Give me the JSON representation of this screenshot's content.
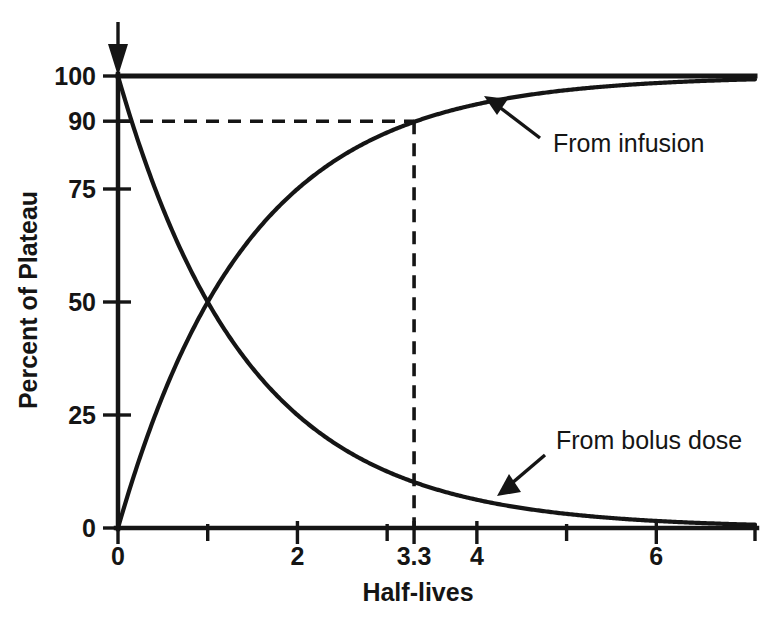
{
  "chart_data": {
    "type": "line",
    "title": "",
    "xlabel": "Half-lives",
    "ylabel": "Percent of Plateau",
    "xlim": [
      0,
      7.1
    ],
    "ylim": [
      0,
      104
    ],
    "grid": false,
    "legend_position": "inline-annotations",
    "x_ticks": [
      {
        "value": 0,
        "label": "0"
      },
      {
        "value": 1,
        "label": ""
      },
      {
        "value": 2,
        "label": "2"
      },
      {
        "value": 3,
        "label": ""
      },
      {
        "value": 3.3,
        "label": "3.3"
      },
      {
        "value": 4,
        "label": "4"
      },
      {
        "value": 5,
        "label": ""
      },
      {
        "value": 6,
        "label": "6"
      },
      {
        "value": 7.1,
        "label": ""
      }
    ],
    "y_ticks": [
      {
        "value": 0,
        "label": "0"
      },
      {
        "value": 25,
        "label": "25"
      },
      {
        "value": 50,
        "label": "50"
      },
      {
        "value": 75,
        "label": "75"
      },
      {
        "value": 90,
        "label": "90"
      },
      {
        "value": 100,
        "label": "100"
      }
    ],
    "series": [
      {
        "name": "From infusion",
        "formula": "100 * (1 - 2^-t)",
        "x": [
          0,
          0.25,
          0.5,
          0.75,
          1,
          1.25,
          1.5,
          1.75,
          2,
          2.5,
          3,
          3.3,
          3.5,
          4,
          4.5,
          5,
          5.5,
          6,
          6.5,
          7.1
        ],
        "values": [
          0,
          15.9,
          29.3,
          40.5,
          50,
          57.9,
          64.6,
          70.3,
          75,
          82.3,
          87.5,
          89.9,
          91.2,
          93.8,
          95.6,
          96.9,
          97.8,
          98.4,
          98.9,
          99.3
        ]
      },
      {
        "name": "From bolus dose",
        "formula": "100 * 2^-t",
        "x": [
          0,
          0.25,
          0.5,
          0.75,
          1,
          1.25,
          1.5,
          1.75,
          2,
          2.5,
          3,
          3.3,
          3.5,
          4,
          4.5,
          5,
          5.5,
          6,
          6.5,
          7.1
        ],
        "values": [
          100,
          84.1,
          70.7,
          59.5,
          50,
          42.0,
          35.4,
          29.7,
          25,
          17.7,
          12.5,
          10.1,
          8.8,
          6.25,
          4.4,
          3.1,
          2.2,
          1.56,
          1.1,
          0.7
        ]
      },
      {
        "name": "Plateau (100%)",
        "formula": "100",
        "x": [
          0,
          7.1
        ],
        "values": [
          100,
          100
        ]
      }
    ],
    "annotations": [
      {
        "name": "from-infusion-label",
        "text": "From infusion",
        "x": 4.35,
        "y": 78
      },
      {
        "name": "from-bolus-label",
        "text": "From bolus dose",
        "x": 5.05,
        "y": 24
      },
      {
        "name": "dose-arrow",
        "text": "",
        "x": 0,
        "y": 100
      }
    ],
    "reference_lines": [
      {
        "name": "ninety-percent-horizontal",
        "orientation": "horizontal",
        "value": 90,
        "style": "dashed",
        "from": 0,
        "to": 3.3
      },
      {
        "name": "three-point-three-vertical",
        "orientation": "vertical",
        "value": 3.3,
        "style": "dashed",
        "from": 0,
        "to": 90
      }
    ]
  },
  "axis_titles": {
    "x": "Half-lives",
    "y": "Percent of Plateau"
  },
  "colors": {
    "ink": "#151515",
    "background": "#ffffff"
  }
}
